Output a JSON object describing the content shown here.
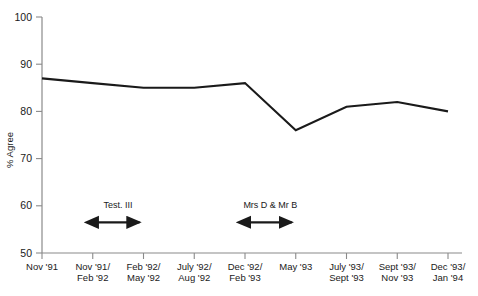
{
  "chart_data": {
    "type": "line",
    "title": "",
    "xlabel": "",
    "ylabel": "% Agree",
    "ylim": [
      50,
      100
    ],
    "yticks": [
      50,
      60,
      70,
      80,
      90,
      100
    ],
    "ytick_labels": [
      "50",
      "60",
      "70",
      "80",
      "90",
      "100"
    ],
    "grid": false,
    "legend": "none",
    "categories": [
      "Nov '91",
      "Nov '91/\nFeb '92",
      "Feb '92/\nMay '92",
      "July '92/\nAug '92",
      "Dec '92/\nFeb '93",
      "May '93",
      "July '93/\nSept '93",
      "Sept '93/\nNov '93",
      "Dec '93/\nJan '94"
    ],
    "category_lines": [
      [
        "Nov '91",
        ""
      ],
      [
        "Nov '91/",
        "Feb '92"
      ],
      [
        "Feb '92/",
        "May '92"
      ],
      [
        "July '92/",
        "Aug '92"
      ],
      [
        "Dec '92/",
        "Feb '93"
      ],
      [
        "May '93",
        ""
      ],
      [
        "July '93/",
        "Sept '93"
      ],
      [
        "Sept '93/",
        "Nov '93"
      ],
      [
        "Dec '93/",
        "Jan '94"
      ]
    ],
    "values": [
      87,
      86,
      85,
      85,
      86,
      76,
      81,
      82,
      80
    ],
    "series": [
      {
        "name": "% Agree",
        "values": [
          87,
          86,
          85,
          85,
          86,
          76,
          81,
          82,
          80
        ],
        "color": "#1a1a1a"
      }
    ],
    "annotations": [
      {
        "label": "Test. III",
        "type": "double-arrow",
        "start_category": "Nov '91/\nFeb '92",
        "end_category": "Feb '92/\nMay '92",
        "y_value": 56.5,
        "label_y_value": 59.5
      },
      {
        "label": "Mrs D & Mr B",
        "type": "double-arrow",
        "start_category": "Dec '92/\nFeb '93",
        "end_category": "May '93",
        "y_value": 56.5,
        "label_y_value": 59.5
      }
    ],
    "colors": {
      "line": "#1a1a1a",
      "axis": "#8a8a8a",
      "text": "#1a1a1a",
      "background": "#ffffff"
    }
  }
}
